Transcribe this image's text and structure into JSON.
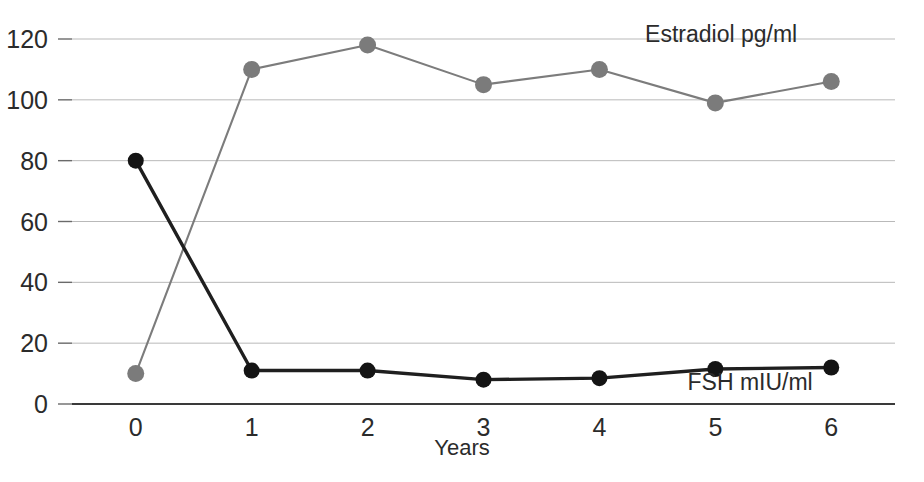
{
  "chart_data": {
    "type": "line",
    "title": "",
    "xlabel": "Years",
    "ylabel": "",
    "x": [
      0,
      1,
      2,
      3,
      4,
      5,
      6
    ],
    "xticklabels": [
      "0",
      "1",
      "2",
      "3",
      "4",
      "5",
      "6"
    ],
    "yticks": [
      0,
      20,
      40,
      60,
      80,
      100,
      120
    ],
    "yticklabels": [
      "0",
      "20",
      "40",
      "60",
      "80",
      "100",
      "120"
    ],
    "xlim": [
      -0.55,
      6.55
    ],
    "ylim": [
      0,
      128
    ],
    "grid": "horizontal",
    "legend_position": "inline-end-of-series",
    "series": [
      {
        "name": "Estradiol  pg/ml",
        "label_short": "Estradiol",
        "units": "pg/ml",
        "color": "#7b7b7b",
        "marker": "circle",
        "values": [
          10,
          110,
          118,
          105,
          110,
          99,
          106
        ]
      },
      {
        "name": "FSH mIU/ml",
        "label_short": "FSH",
        "units": "mIU/ml",
        "color": "#141414",
        "marker": "circle",
        "values": [
          80,
          11,
          11,
          8,
          8.5,
          11.5,
          12
        ]
      }
    ],
    "annotations": [
      {
        "text": "Estradiol  pg/ml",
        "x": 5.05,
        "y": 119
      },
      {
        "text": "FSH mIU/ml",
        "x": 5.3,
        "y": 4.5
      }
    ]
  },
  "colors": {
    "background": "#ffffff",
    "gridline": "#b9b9b9",
    "axis": "#3a3a3a",
    "estradiol": "#7b7b7b",
    "fsh": "#141414",
    "text": "#2b2b2b"
  }
}
